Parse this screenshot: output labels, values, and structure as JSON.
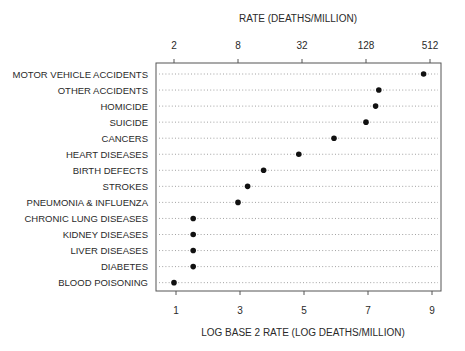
{
  "chart_data": {
    "type": "scatter",
    "subtype": "dot-plot",
    "top_axis_title": "RATE (DEATHS/MILLION)",
    "xlabel": "LOG BASE 2 RATE (LOG DEATHS/MILLION)",
    "ylabel": "",
    "xlim": [
      0.9,
      9.1
    ],
    "x_ticks_bottom": [
      1,
      3,
      5,
      7,
      9
    ],
    "x_tick_labels_bottom": [
      "1",
      "3",
      "5",
      "7",
      "9"
    ],
    "x_ticks_top": [
      1,
      3,
      5,
      7,
      9
    ],
    "x_tick_labels_top": [
      "2",
      "8",
      "32",
      "128",
      "512"
    ],
    "grid": "dotted horizontal guide lines per category",
    "categories": [
      "MOTOR VEHICLE ACCIDENTS",
      "OTHER ACCIDENTS",
      "HOMICIDE",
      "SUICIDE",
      "CANCERS",
      "HEART DISEASES",
      "BIRTH DEFECTS",
      "STROKES",
      "PNEUMONIA & INFLUENZA",
      "CHRONIC LUNG DISEASES",
      "KIDNEY DISEASES",
      "LIVER DISEASES",
      "DIABETES",
      "BLOOD POISONING"
    ],
    "values": [
      8.8,
      7.4,
      7.3,
      7.0,
      6.0,
      4.9,
      3.8,
      3.3,
      3.0,
      1.6,
      1.6,
      1.6,
      1.6,
      1.0
    ],
    "colors": {
      "point": "#111111",
      "frame": "#555555",
      "text": "#2a2a2a"
    }
  }
}
